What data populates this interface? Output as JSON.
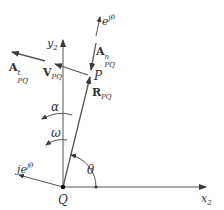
{
  "diagram": {
    "type": "vector diagram",
    "colors": {
      "line": "#4a4a4a",
      "background": "#ffffff",
      "text": "#333333"
    },
    "points": {
      "Q": {
        "label": "Q",
        "x": 63,
        "y": 187
      },
      "P": {
        "label": "P",
        "x": 91,
        "y": 73
      }
    },
    "axes": {
      "x": {
        "base": "x",
        "sub": "2"
      },
      "y": {
        "base": "y",
        "sub": "2"
      }
    },
    "vectors": {
      "R": {
        "base": "R",
        "sub": "PQ"
      },
      "V": {
        "base": "V",
        "sub": "PQ"
      },
      "At": {
        "base": "A",
        "sup": "t",
        "sub": "PQ"
      },
      "An": {
        "base": "A",
        "sup": "n",
        "sub": "PQ"
      },
      "ejtheta": {
        "base": "e",
        "sup": "jθ"
      },
      "jejtheta": {
        "base": "je",
        "sup": "jθ"
      }
    },
    "angles": {
      "theta": "θ",
      "alpha": "α",
      "omega": "ω"
    }
  }
}
